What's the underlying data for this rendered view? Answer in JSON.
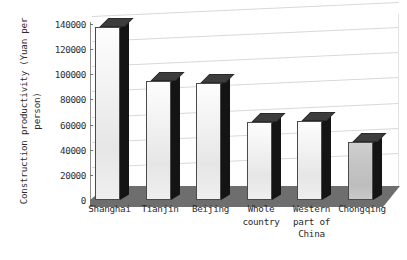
{
  "chart_data": {
    "type": "bar",
    "title": "",
    "subtitle": "",
    "xlabel": "",
    "ylabel": "Construction productivity (Yuan per person)",
    "ylabel_lines": [
      "Construction productivity (Yuan per",
      "person)"
    ],
    "categories": [
      "Shanghai",
      "Tianjin",
      "Beijing",
      "Whole country",
      "Western part of China",
      "Chongqing"
    ],
    "category_label_lines": [
      [
        "Shanghai"
      ],
      [
        "Tianjin"
      ],
      [
        "Beijing"
      ],
      [
        "Whole",
        "country"
      ],
      [
        "Western",
        "part of",
        "China"
      ],
      [
        "Chongqing"
      ]
    ],
    "values": [
      138000,
      95000,
      93000,
      62000,
      63000,
      46000
    ],
    "ylim": [
      0,
      140000
    ],
    "yticks": [
      0,
      20000,
      40000,
      60000,
      80000,
      100000,
      120000,
      140000
    ],
    "ytick_labels": [
      "0",
      "20000",
      "40000",
      "60000",
      "80000",
      "100000",
      "120000",
      "140000"
    ],
    "grid": true,
    "legend": false,
    "legend_position": "none",
    "style": "3d-column",
    "series": [
      {
        "name": "Construction productivity",
        "values": [
          138000,
          95000,
          93000,
          62000,
          63000,
          46000
        ]
      }
    ]
  },
  "colors": {
    "background": "#ffffff",
    "bar_face": "#f0f0f0",
    "bar_face_last": "#c6c6c6",
    "bar_side": "#141414",
    "bar_top": "#3d3d3d",
    "floor": "#6e6e6e",
    "gridline": "#d8d8d8",
    "axis": "#8c8c8c",
    "text": "#2b2b2b"
  }
}
